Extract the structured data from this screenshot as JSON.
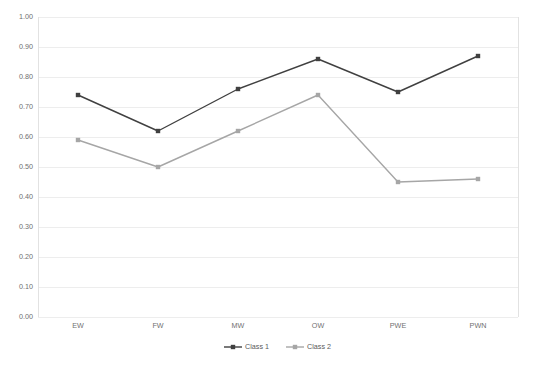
{
  "chart_data": {
    "type": "line",
    "title": "",
    "subtitle": "",
    "xlabel": "",
    "ylabel": "",
    "categories": [
      "EW",
      "FW",
      "MW",
      "OW",
      "PWE",
      "PWN"
    ],
    "series": [
      {
        "name": "Class 1",
        "values": [
          0.74,
          0.62,
          0.76,
          0.86,
          0.75,
          0.87
        ],
        "color": "#404040",
        "marker": "square"
      },
      {
        "name": "Class 2",
        "values": [
          0.59,
          0.5,
          0.62,
          0.74,
          0.45,
          0.46
        ],
        "color": "#a6a6a6",
        "marker": "square"
      }
    ],
    "ylim": [
      0.0,
      1.0
    ],
    "ytick_labels": [
      "1.00",
      "0.90",
      "0.80",
      "0.70",
      "0.60",
      "0.50",
      "0.40",
      "0.30",
      "0.20",
      "0.10",
      "0.00"
    ],
    "ytick_values": [
      1.0,
      0.9,
      0.8,
      0.7,
      0.6,
      0.5,
      0.4,
      0.3,
      0.2,
      0.1,
      0.0
    ],
    "grid": true,
    "grid_color": "#ededed",
    "legend_position": "bottom",
    "legend": [
      "Class 1",
      "Class 2"
    ],
    "background": "#ffffff",
    "plot_left": 38,
    "plot_right": 518,
    "plot_top": 17,
    "plot_bottom": 317
  }
}
